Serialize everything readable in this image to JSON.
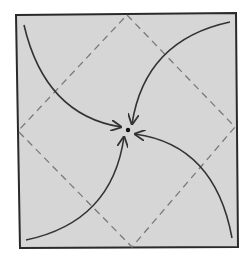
{
  "diagram": {
    "type": "origami-fold-diagram",
    "colors": {
      "paper_fill": "#d6d6d6",
      "border": "#2a2a2a",
      "dashed_line": "#7a7a7a",
      "arrow": "#333333",
      "center_dot": "#111111"
    },
    "square": {
      "corners": [
        [
          16,
          15
        ],
        [
          236,
          13
        ],
        [
          238,
          247
        ],
        [
          20,
          248
        ]
      ]
    },
    "dashed_diamond": {
      "vertices": [
        [
          127,
          15
        ],
        [
          235,
          127
        ],
        [
          132,
          247
        ],
        [
          18,
          131
        ]
      ]
    },
    "center_point": [
      128,
      130
    ],
    "arrows": [
      {
        "name": "arrow-top-left",
        "from": [
          24,
          25
        ],
        "to": [
          121,
          127
        ]
      },
      {
        "name": "arrow-top-right",
        "from": [
          230,
          22
        ],
        "to": [
          132,
          124
        ]
      },
      {
        "name": "arrow-bottom-right",
        "from": [
          232,
          238
        ],
        "to": [
          135,
          134
        ]
      },
      {
        "name": "arrow-bottom-left",
        "from": [
          26,
          240
        ],
        "to": [
          124,
          137
        ]
      }
    ]
  }
}
